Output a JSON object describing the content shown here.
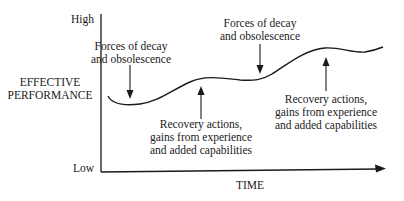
{
  "diagram": {
    "y_axis": {
      "label_lines": [
        "EFFECTIVE",
        "PERFORMANCE"
      ],
      "high_label": "High",
      "low_label": "Low"
    },
    "x_axis": {
      "label": "TIME"
    },
    "annotations": [
      {
        "id": "decay-1",
        "kind": "down-arrow",
        "lines": [
          "Forces of decay",
          "and obsolescence"
        ]
      },
      {
        "id": "recovery-1",
        "kind": "up-arrow",
        "lines": [
          "Recovery actions,",
          "gains from experience",
          "and added capabilities"
        ]
      },
      {
        "id": "decay-2",
        "kind": "down-arrow",
        "lines": [
          "Forces of decay",
          "and obsolescence"
        ]
      },
      {
        "id": "recovery-2",
        "kind": "up-arrow",
        "lines": [
          "Recovery actions,",
          "gains from experience",
          "and added capabilities"
        ]
      }
    ],
    "curve": {
      "description": "Effective performance over time: dips from decay forces, rises from recovery actions, net upward trend",
      "colors": {
        "line": "#1a1a1a",
        "background": "#ffffff"
      }
    }
  }
}
